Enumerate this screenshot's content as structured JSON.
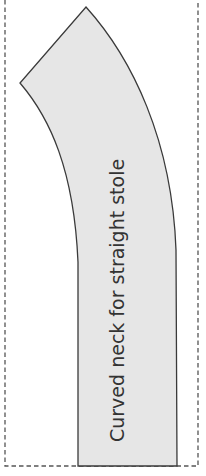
{
  "diagram": {
    "label": "Curved neck for straight stole",
    "colors": {
      "fill": "#e6e6e6",
      "stroke": "#3a3a3a",
      "dashed_border": "#555555",
      "text": "#333333",
      "background": "#ffffff"
    },
    "shape": "stole-pattern-piece",
    "border_style": "dashed"
  }
}
